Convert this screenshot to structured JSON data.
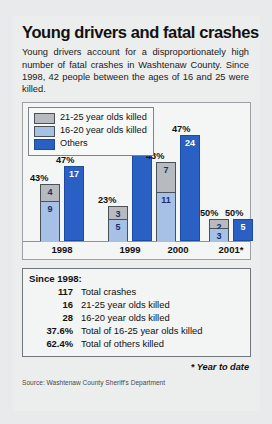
{
  "title": "Young drivers and fatal crashes",
  "intro": "Young drivers account for a disproportionately high number of fatal crashes in Washtenaw County. Since 1998, 42 people between the ages of 16 and 25 were killed.",
  "legend": [
    {
      "swatch": "gray",
      "label": "21-25 year olds killed"
    },
    {
      "swatch": "lblue",
      "label": "16-20 year olds killed"
    },
    {
      "swatch": "blue",
      "label": "Others"
    }
  ],
  "chart_data": {
    "type": "bar",
    "title": "Young drivers and fatal crashes",
    "xlabel": "",
    "ylabel": "",
    "ylim": [
      0,
      28
    ],
    "grid": false,
    "legend_position": "top-left",
    "categories": [
      "1998",
      "1999",
      "2000",
      "2001*"
    ],
    "series": [
      {
        "name": "21-25 year olds killed",
        "values": [
          4,
          3,
          7,
          2
        ]
      },
      {
        "name": "16-20 year olds killed",
        "values": [
          9,
          5,
          11,
          3
        ]
      },
      {
        "name": "Others",
        "values": [
          17,
          27,
          24,
          5
        ]
      }
    ],
    "annotations": {
      "young_pct": [
        "43%",
        "23%",
        "43%",
        "50%"
      ],
      "others_pct": [
        "47%",
        "77%",
        "47%",
        "50%"
      ]
    }
  },
  "summary": {
    "heading": "Since 1998:",
    "rows": [
      {
        "value": "117",
        "label": "Total crashes"
      },
      {
        "value": "16",
        "label": "21-25 year olds killed"
      },
      {
        "value": "28",
        "label": "16-20 year olds killed"
      },
      {
        "value": "37.6%",
        "label": "Total of 16-25 year olds killed"
      },
      {
        "value": "62.4%",
        "label": "Total of others killed"
      }
    ]
  },
  "footnote": "* Year to date",
  "source": "Source: Washtenaw County Sheriff's Department"
}
